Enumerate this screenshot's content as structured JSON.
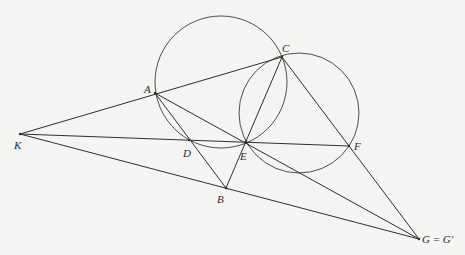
{
  "diagram": {
    "type": "geometry-construction",
    "points": {
      "A": {
        "label": "A",
        "x": 155,
        "y": 93
      },
      "B": {
        "label": "B",
        "x": 226,
        "y": 188
      },
      "C": {
        "label": "C",
        "x": 282,
        "y": 57
      },
      "D": {
        "label": "D",
        "x": 189,
        "y": 140
      },
      "E": {
        "label": "E",
        "x": 246,
        "y": 142
      },
      "F": {
        "label": "F",
        "x": 349,
        "y": 146
      },
      "K": {
        "label": "K",
        "x": 20,
        "y": 134
      },
      "G": {
        "label": "G = G′",
        "x": 419,
        "y": 239
      }
    },
    "circles": [
      {
        "name": "circle-ACDE",
        "cx": 221,
        "cy": 82,
        "r": 66
      },
      {
        "name": "circle-CEF",
        "cx": 299,
        "cy": 113,
        "r": 60
      }
    ],
    "segments": [
      {
        "name": "segment-KC",
        "from": "K",
        "to": "C"
      },
      {
        "name": "segment-KF",
        "from": "K",
        "to": "F"
      },
      {
        "name": "segment-KG",
        "from": "K",
        "to": "G"
      },
      {
        "name": "segment-AG",
        "from": "A",
        "to": "G"
      },
      {
        "name": "segment-AB",
        "from": "A",
        "to": "B"
      },
      {
        "name": "segment-CB",
        "from": "C",
        "to": "B"
      },
      {
        "name": "segment-CG",
        "from": "C",
        "to": "G"
      }
    ],
    "labels": {
      "A": "A",
      "B": "B",
      "C": "C",
      "D": "D",
      "E": "E",
      "F": "F",
      "K": "K",
      "G": "G = G′"
    }
  }
}
